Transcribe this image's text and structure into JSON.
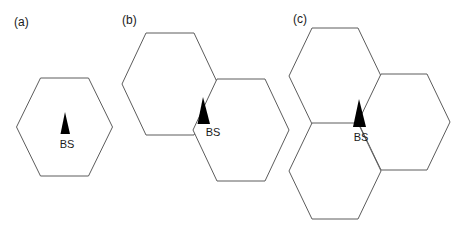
{
  "figure": {
    "background_color": "#ffffff",
    "stroke_color": "#5c5c5c",
    "marker_color": "#000000",
    "label_color": "#1a1a1a",
    "width": 471,
    "height": 233
  },
  "panels": [
    {
      "id": "a",
      "label": "(a)",
      "label_x": 14,
      "label_y": 26,
      "cell_count": 1,
      "bs_label": "BS",
      "bs_label_x": 67,
      "bs_label_y": 148,
      "bs_marker_x": 65,
      "bs_marker_y": 134,
      "hexagons": [
        {
          "name": "center-cell",
          "cx": 64.5,
          "cy": 127,
          "rx": 48,
          "ry": 50
        }
      ],
      "markers": [
        {
          "name": "base-station-a",
          "apex_x": 65,
          "apex_y": 112,
          "base_left_x": 60,
          "base_right_x": 70,
          "base_y": 134
        }
      ]
    },
    {
      "id": "b",
      "label": "(b)",
      "label_x": 122,
      "label_y": 24,
      "cell_count": 2,
      "bs_label": "BS",
      "bs_label_x": 211,
      "bs_label_y": 136,
      "hexagons": [
        {
          "name": "upper-left-cell",
          "cx": 170,
          "cy": 84,
          "rx": 48,
          "ry": 51
        },
        {
          "name": "lower-right-cell",
          "cx": 241,
          "cy": 130,
          "rx": 48,
          "ry": 51
        }
      ],
      "markers": [
        {
          "name": "base-station-b",
          "apex_x": 203,
          "apex_y": 97,
          "base_left_x": 198,
          "base_right_x": 210,
          "base_y": 124
        }
      ]
    },
    {
      "id": "c",
      "label": "(c)",
      "label_x": 293,
      "label_y": 23,
      "cell_count": 3,
      "bs_label": "BS",
      "bs_label_x": 360,
      "bs_label_y": 144,
      "hexagons": [
        {
          "name": "upper-left-cell",
          "cx": 334,
          "cy": 76,
          "rx": 46,
          "ry": 49
        },
        {
          "name": "right-cell",
          "cx": 406,
          "cy": 122,
          "rx": 46,
          "ry": 49
        },
        {
          "name": "lower-left-cell",
          "cx": 334,
          "cy": 170,
          "rx": 46,
          "ry": 49
        }
      ],
      "markers": [
        {
          "name": "base-station-c",
          "apex_x": 359,
          "apex_y": 99,
          "base_left_x": 353,
          "base_right_x": 366,
          "base_y": 127
        }
      ]
    }
  ],
  "legend": {
    "bs_text": "BS",
    "bs_meaning": "Base Station"
  }
}
